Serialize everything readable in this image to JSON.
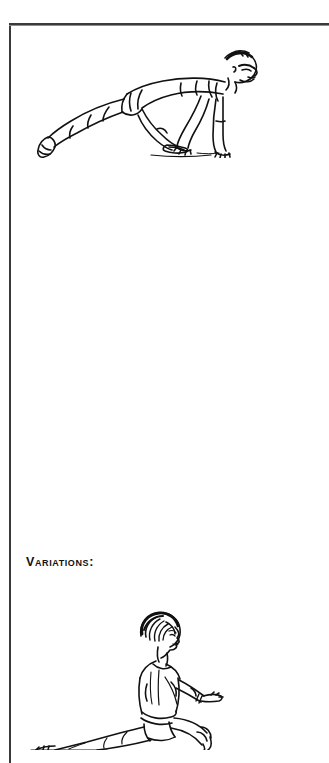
{
  "page": {
    "background_color": "#ffffff",
    "width": 317,
    "height": 743
  },
  "frame": {
    "name": "page-rule-frame",
    "color": "#3a3a3a",
    "hairline_color": "#8d8d8d",
    "style": "open box, top and left rules visible, right and bottom rules cropped by page edge"
  },
  "headings": {
    "variations_label": "Variations:"
  },
  "figures": [
    {
      "id": "figure-top",
      "name": "runner-lunge-illustration",
      "caption_text": "",
      "alt": "Line drawing of a man in a deep runner's lunge: back leg extended straight behind, front knee bent, both hands planted on the floor, head lowered and facing right.",
      "style": "black-and-white pen line art",
      "ink_color": "#111111"
    },
    {
      "id": "figure-bottom",
      "name": "low-lunge-stretch-illustration",
      "caption_text": "",
      "alt": "Line drawing of a woman in a low lunge stretch: back leg extended along the floor, front knee bent, torso upright, arms reaching forward.",
      "style": "black-and-white pen line art",
      "ink_color": "#111111"
    }
  ]
}
